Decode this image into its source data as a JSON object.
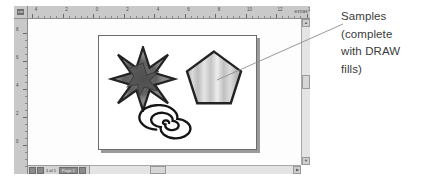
{
  "window": {
    "ruler_corner_label": "cm",
    "horizontal_ruler": {
      "unit_label": "extras",
      "labels": [
        "4",
        "2",
        "0",
        "2",
        "4",
        "6",
        "8",
        "10",
        "12",
        "14"
      ]
    },
    "vertical_ruler": {
      "labels": [
        "8",
        "6",
        "4",
        "2",
        "0"
      ]
    }
  },
  "canvas": {
    "shapes": [
      {
        "name": "star",
        "label": "8-point star",
        "fill": "#808080",
        "stroke": "#2b2b2b",
        "points": 8
      },
      {
        "name": "pentagon",
        "label": "pentagon",
        "fill": "#c9c9c9",
        "stroke": "#2b2b2b",
        "points": 5
      },
      {
        "name": "spiral",
        "label": "spiral",
        "fill": "none",
        "stroke": "#111111",
        "turns": 4
      }
    ]
  },
  "scrollbars": {
    "vertical_up": "▲",
    "vertical_down": "▼",
    "horizontal_right": "▶"
  },
  "page_navigator": {
    "page_label": "1 of 1",
    "page_tab": "Page 1"
  },
  "annotation": {
    "lines": [
      "Samples",
      "(complete",
      "with DRAW",
      "fills)"
    ],
    "full_text": "Samples (complete with DRAW fills)",
    "leader_color": "#8d8d8d"
  },
  "colors": {
    "ruler": "#c9c9c9",
    "workspace": "#fdfdfd",
    "page": "#ffffff",
    "page_border": "#6d6d6d",
    "page_shadow": "#9b9b9b",
    "text": "#3b3b3b"
  }
}
